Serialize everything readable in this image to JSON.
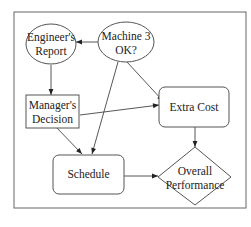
{
  "diagram": {
    "type": "influence-diagram",
    "nodes": {
      "engineers_report": {
        "line1": "Engineer's",
        "line2": "Report",
        "shape": "ellipse"
      },
      "machine3_ok": {
        "line1": "Machine 3",
        "line2": "OK?",
        "shape": "ellipse"
      },
      "managers_decision": {
        "line1": "Manager's",
        "line2": "Decision",
        "shape": "rectangle"
      },
      "extra_cost": {
        "label": "Extra Cost",
        "shape": "rounded-rectangle"
      },
      "schedule": {
        "label": "Schedule",
        "shape": "rounded-rectangle"
      },
      "overall_performance": {
        "line1": "Overall",
        "line2": "Performance",
        "shape": "diamond"
      }
    },
    "edges": [
      {
        "from": "Machine 3 OK?",
        "to": "Engineer's Report"
      },
      {
        "from": "Engineer's Report",
        "to": "Manager's Decision"
      },
      {
        "from": "Machine 3 OK?",
        "to": "Extra Cost"
      },
      {
        "from": "Machine 3 OK?",
        "to": "Schedule"
      },
      {
        "from": "Manager's Decision",
        "to": "Extra Cost"
      },
      {
        "from": "Manager's Decision",
        "to": "Schedule"
      },
      {
        "from": "Extra Cost",
        "to": "Overall Performance"
      },
      {
        "from": "Schedule",
        "to": "Overall Performance"
      }
    ]
  }
}
